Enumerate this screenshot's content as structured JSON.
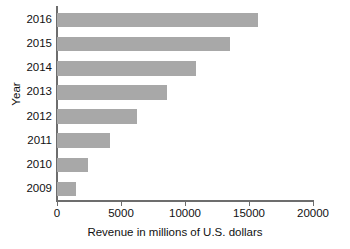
{
  "chart_data": {
    "type": "bar",
    "orientation": "horizontal",
    "title": "",
    "subtitle": "",
    "xlabel": "Revenue in millions of U.S. dollars",
    "ylabel": "Year",
    "categories": [
      "2016",
      "2015",
      "2014",
      "2013",
      "2012",
      "2011",
      "2010",
      "2009"
    ],
    "values": [
      15700,
      13500,
      10860,
      8600,
      6250,
      4140,
      2420,
      1480
    ],
    "series": [
      {
        "name": "Revenue",
        "values": [
          15700,
          13500,
          10860,
          8600,
          6250,
          4140,
          2420,
          1480
        ]
      }
    ],
    "xlim": [
      0,
      20000
    ],
    "xticks": [
      0,
      5000,
      10000,
      15000,
      20000
    ],
    "xtick_labels": [
      "0",
      "5000",
      "10000",
      "15000",
      "20000"
    ],
    "grid": false,
    "legend": false,
    "legend_position": "none",
    "bar_color": "#a8a8a8",
    "axis_color": "#6d6d6d",
    "background_color": "#ffffff",
    "data_labels": false
  }
}
